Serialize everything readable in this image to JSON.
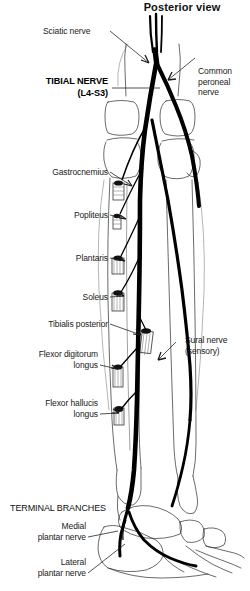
{
  "figure": {
    "title": "Posterior view",
    "background_color": "#ffffff",
    "ink_color": "#000000"
  },
  "nerve": {
    "main_name": "TIBIAL NERVE",
    "roots": "(L4-S3)"
  },
  "labels": {
    "sciatic": "Sciatic nerve",
    "common_peroneal": "Common\nperoneal\nnerve",
    "gastrocnemius": "Gastrocnemius",
    "popliteus": "Popliteus",
    "plantaris": "Plantaris",
    "soleus": "Soleus",
    "tibialis_posterior": "Tibialis posterior",
    "flexor_digitorum_longus": "Flexor digitorum\nlongus",
    "flexor_hallucis_longus": "Flexor hallucis\nlongus",
    "sural": "Sural nerve\n(sensory)",
    "terminal_branches": "TERMINAL BRANCHES",
    "medial_plantar": "Medial\nplantar nerve",
    "lateral_plantar": "Lateral\nplantar nerve"
  }
}
